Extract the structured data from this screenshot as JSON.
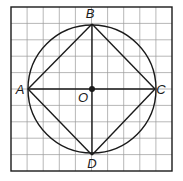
{
  "figure": {
    "type": "geometry-diagram",
    "grid": {
      "x0": 11,
      "y0": 7,
      "x1": 172,
      "y1": 171,
      "cols": 10,
      "rows": 10,
      "color": "#9a9a9a",
      "border_color": "#1a1a1a"
    },
    "circle": {
      "cx": 92,
      "cy": 89,
      "r": 64,
      "label": "O"
    },
    "points": [
      {
        "name": "A",
        "x": 28,
        "y": 89,
        "label_x": 20,
        "label_y": 94
      },
      {
        "name": "B",
        "x": 92,
        "y": 24,
        "label_x": 90,
        "label_y": 18
      },
      {
        "name": "C",
        "x": 155,
        "y": 89,
        "label_x": 161,
        "label_y": 94
      },
      {
        "name": "D",
        "x": 92,
        "y": 155,
        "label_x": 92,
        "label_y": 168
      },
      {
        "name": "O",
        "x": 92,
        "y": 89,
        "label_x": 83,
        "label_y": 102
      }
    ],
    "segments": [
      "AB",
      "BC",
      "CD",
      "DA",
      "AC",
      "BD"
    ],
    "line_color": "#1a1a1a"
  }
}
